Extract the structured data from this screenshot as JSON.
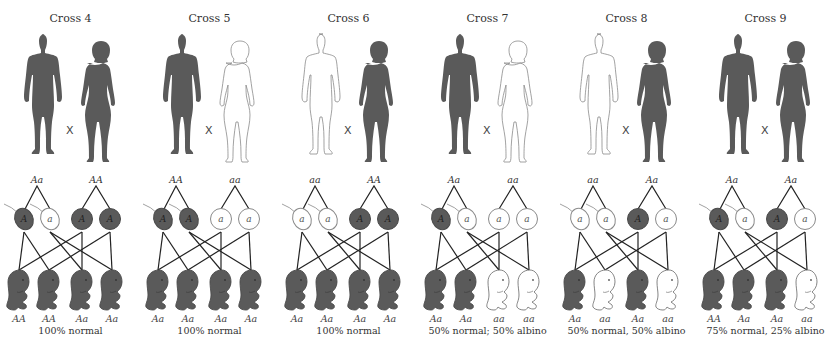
{
  "colors": {
    "dark": "#5a5a5a",
    "outline": "#8a8a8a",
    "line": "#222222",
    "background": "#ffffff"
  },
  "crosses": [
    {
      "title": "Cross 4",
      "father": {
        "phenotype": "normal",
        "genotype": "Aa"
      },
      "mother": {
        "phenotype": "normal",
        "genotype": "AA"
      },
      "sperm": [
        "A",
        "a"
      ],
      "eggs": [
        "A",
        "A"
      ],
      "offspring": [
        {
          "genotype": "AA",
          "phenotype": "normal"
        },
        {
          "genotype": "AA",
          "phenotype": "normal"
        },
        {
          "genotype": "Aa",
          "phenotype": "normal"
        },
        {
          "genotype": "Aa",
          "phenotype": "normal"
        }
      ],
      "summary": "100% normal"
    },
    {
      "title": "Cross 5",
      "father": {
        "phenotype": "normal",
        "genotype": "AA"
      },
      "mother": {
        "phenotype": "albino",
        "genotype": "aa"
      },
      "sperm": [
        "A",
        "A"
      ],
      "eggs": [
        "a",
        "a"
      ],
      "offspring": [
        {
          "genotype": "Aa",
          "phenotype": "normal"
        },
        {
          "genotype": "Aa",
          "phenotype": "normal"
        },
        {
          "genotype": "Aa",
          "phenotype": "normal"
        },
        {
          "genotype": "Aa",
          "phenotype": "normal"
        }
      ],
      "summary": "100% normal"
    },
    {
      "title": "Cross 6",
      "father": {
        "phenotype": "albino",
        "genotype": "aa"
      },
      "mother": {
        "phenotype": "normal",
        "genotype": "AA"
      },
      "sperm": [
        "a",
        "a"
      ],
      "eggs": [
        "A",
        "A"
      ],
      "offspring": [
        {
          "genotype": "Aa",
          "phenotype": "normal"
        },
        {
          "genotype": "Aa",
          "phenotype": "normal"
        },
        {
          "genotype": "Aa",
          "phenotype": "normal"
        },
        {
          "genotype": "Aa",
          "phenotype": "normal"
        }
      ],
      "summary": "100% normal"
    },
    {
      "title": "Cross 7",
      "father": {
        "phenotype": "normal",
        "genotype": "Aa"
      },
      "mother": {
        "phenotype": "albino",
        "genotype": "aa"
      },
      "sperm": [
        "A",
        "a"
      ],
      "eggs": [
        "a",
        "a"
      ],
      "offspring": [
        {
          "genotype": "Aa",
          "phenotype": "normal"
        },
        {
          "genotype": "Aa",
          "phenotype": "normal"
        },
        {
          "genotype": "aa",
          "phenotype": "albino"
        },
        {
          "genotype": "aa",
          "phenotype": "albino"
        }
      ],
      "summary": "50% normal; 50% albino"
    },
    {
      "title": "Cross 8",
      "father": {
        "phenotype": "albino",
        "genotype": "aa"
      },
      "mother": {
        "phenotype": "normal",
        "genotype": "Aa"
      },
      "sperm": [
        "a",
        "a"
      ],
      "eggs": [
        "A",
        "a"
      ],
      "offspring": [
        {
          "genotype": "Aa",
          "phenotype": "normal"
        },
        {
          "genotype": "aa",
          "phenotype": "albino"
        },
        {
          "genotype": "Aa",
          "phenotype": "normal"
        },
        {
          "genotype": "aa",
          "phenotype": "albino"
        }
      ],
      "summary": "50% normal, 50% albino"
    },
    {
      "title": "Cross 9",
      "father": {
        "phenotype": "normal",
        "genotype": "Aa"
      },
      "mother": {
        "phenotype": "normal",
        "genotype": "Aa"
      },
      "sperm": [
        "A",
        "a"
      ],
      "eggs": [
        "A",
        "a"
      ],
      "offspring": [
        {
          "genotype": "AA",
          "phenotype": "normal"
        },
        {
          "genotype": "Aa",
          "phenotype": "normal"
        },
        {
          "genotype": "Aa",
          "phenotype": "normal"
        },
        {
          "genotype": "aa",
          "phenotype": "albino"
        }
      ],
      "summary": "75% normal, 25% albino"
    }
  ],
  "cross_symbol": "X"
}
